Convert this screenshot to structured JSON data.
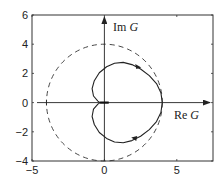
{
  "chart_data": {
    "type": "line",
    "title": "",
    "xlabel": "Re G",
    "ylabel": "Im G",
    "xlim": [
      -5,
      7.5
    ],
    "ylim": [
      -4,
      6
    ],
    "xticks": [
      -5,
      0,
      5
    ],
    "yticks": [
      -4,
      -2,
      0,
      2,
      4,
      6
    ],
    "xtick_labels": [
      "−5",
      "0",
      "5"
    ],
    "ytick_labels": [
      "−4",
      "−2",
      "0",
      "2",
      "4",
      "6"
    ],
    "grid": false,
    "legend": null,
    "axes_arrows": true,
    "labels": {
      "re": {
        "prefix": "Re ",
        "var": "G"
      },
      "im": {
        "prefix": "Im ",
        "var": "G"
      }
    },
    "series": [
      {
        "name": "nyquist-curve",
        "style": "solid",
        "description": "cardioid-shaped Nyquist locus, max Re=4 at Im=0, cusp near origin",
        "points": [
          [
            4.0,
            0.0
          ],
          [
            3.9,
            0.68
          ],
          [
            3.6,
            1.3
          ],
          [
            3.1,
            1.85
          ],
          [
            2.5,
            2.3
          ],
          [
            1.9,
            2.6
          ],
          [
            1.3,
            2.75
          ],
          [
            0.7,
            2.7
          ],
          [
            0.15,
            2.45
          ],
          [
            -0.35,
            2.05
          ],
          [
            -0.7,
            1.5
          ],
          [
            -0.85,
            0.95
          ],
          [
            -0.75,
            0.45
          ],
          [
            -0.45,
            0.1
          ],
          [
            -0.3,
            0.0
          ],
          [
            -0.45,
            -0.1
          ],
          [
            -0.75,
            -0.45
          ],
          [
            -0.85,
            -0.95
          ],
          [
            -0.7,
            -1.5
          ],
          [
            -0.35,
            -2.05
          ],
          [
            0.15,
            -2.45
          ],
          [
            0.7,
            -2.7
          ],
          [
            1.3,
            -2.75
          ],
          [
            1.9,
            -2.6
          ],
          [
            2.5,
            -2.3
          ],
          [
            3.1,
            -1.85
          ],
          [
            3.6,
            -1.3
          ],
          [
            3.9,
            -0.68
          ],
          [
            4.0,
            0.0
          ]
        ],
        "arrows": [
          {
            "at": [
              2.2,
              2.5
            ],
            "direction": "right"
          },
          {
            "at": [
              2.2,
              -2.5
            ],
            "direction": "left"
          }
        ]
      },
      {
        "name": "unit-circle-radius-4",
        "style": "dashed",
        "shape": "circle",
        "center": [
          0,
          0
        ],
        "radius": 4
      }
    ],
    "annotations": [
      {
        "text": "Im G",
        "x": 0.6,
        "y": 4.9
      },
      {
        "text": "Re G",
        "x": 4.8,
        "y": -1.1
      }
    ]
  }
}
